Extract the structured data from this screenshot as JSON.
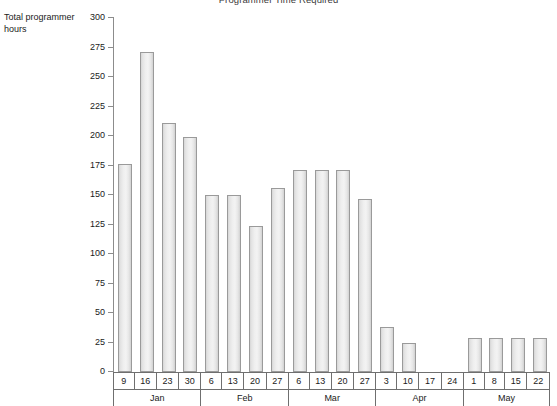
{
  "chart_data": {
    "type": "bar",
    "title": "Programmer Time Required",
    "xlabel": "",
    "ylabel": "Total programmer hours",
    "ylim": [
      0,
      300
    ],
    "ytick_step": 25,
    "yticks": [
      0,
      25,
      50,
      75,
      100,
      125,
      150,
      175,
      200,
      225,
      250,
      275,
      300
    ],
    "grid": false,
    "legend": null,
    "categories": [
      "9",
      "16",
      "23",
      "30",
      "6",
      "13",
      "20",
      "27",
      "6",
      "13",
      "20",
      "27",
      "3",
      "10",
      "17",
      "24",
      "1",
      "8",
      "15",
      "22"
    ],
    "groups": [
      {
        "label": "Jan",
        "weeks": [
          "9",
          "16",
          "23",
          "30"
        ]
      },
      {
        "label": "Feb",
        "weeks": [
          "6",
          "13",
          "20",
          "27"
        ]
      },
      {
        "label": "Mar",
        "weeks": [
          "6",
          "13",
          "20",
          "27"
        ]
      },
      {
        "label": "Apr",
        "weeks": [
          "3",
          "10",
          "17",
          "24"
        ]
      },
      {
        "label": "May",
        "weeks": [
          "1",
          "8",
          "15",
          "22"
        ]
      }
    ],
    "values": [
      176,
      271,
      211,
      199,
      150,
      150,
      124,
      156,
      171,
      171,
      171,
      147,
      38,
      25,
      0,
      0,
      29,
      29,
      29,
      29
    ],
    "bar_color": "#eeeeee",
    "bar_border_color": "#9a9a9a",
    "axis_color": "#8c8c8c"
  }
}
